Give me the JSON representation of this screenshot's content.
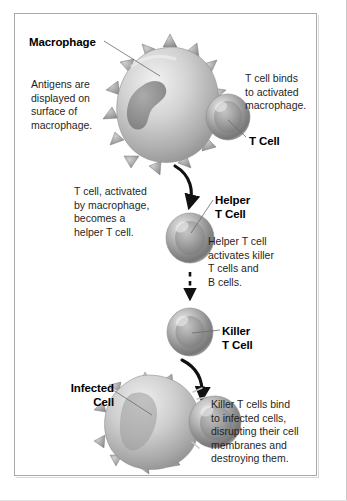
{
  "diagram": {
    "palette": {
      "border": "#a8a8a8",
      "background": "#ffffff",
      "text": "#1f1f1f",
      "label": "#000000",
      "cell_light": "#e3e3e3",
      "cell_mid": "#a9a9a9",
      "cell_dark": "#6e6e6e",
      "arrow": "#111111",
      "leader_line": "#6b6b6b"
    },
    "labels": {
      "macrophage": "Macrophage",
      "t_cell": "T Cell",
      "helper_t_cell": "Helper\nT Cell",
      "killer_t_cell": "Killer\nT Cell",
      "infected_cell": "Infected\nCell"
    },
    "captions": {
      "antigens": "Antigens are\ndisplayed on\nsurface of\nmacrophage.",
      "t_cell_binds": "T cell binds\nto activated\nmacrophage.",
      "t_cell_activated": "T cell, activated\nby macrophage,\nbecomes a\nhelper T cell.",
      "helper_activates": "Helper T cell\nactivates killer\nT cells and\nB cells.",
      "killer_binds": "Killer T cells bind\nto infected cells,\ndisrupting their cell\nmembranes and\ndestroying them."
    },
    "connectors": [
      {
        "name": "macrophage-to-helper",
        "style": "solid-curved-arrow"
      },
      {
        "name": "helper-to-killer",
        "style": "dashed-straight-arrow"
      },
      {
        "name": "killer-to-infected",
        "style": "solid-curved-arrow"
      }
    ],
    "cells": [
      {
        "name": "macrophage",
        "shape": "spiked-blob",
        "has_nucleus": true
      },
      {
        "name": "t-cell",
        "shape": "sphere"
      },
      {
        "name": "helper-t-cell",
        "shape": "sphere"
      },
      {
        "name": "killer-t-cell",
        "shape": "sphere"
      },
      {
        "name": "infected-cell",
        "shape": "spiked-blob",
        "membrane": "disrupted"
      },
      {
        "name": "killer-t-cell-attached",
        "shape": "sphere"
      }
    ]
  }
}
